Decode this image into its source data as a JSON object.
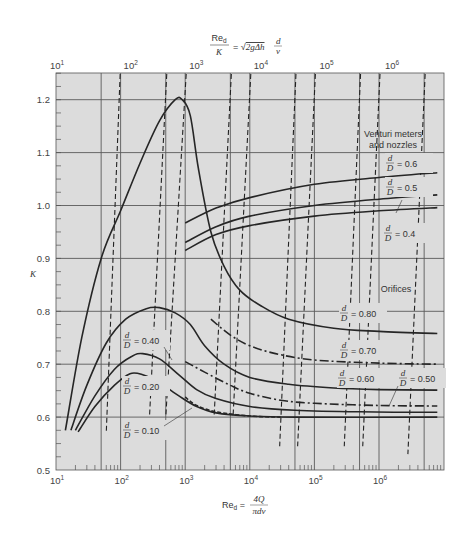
{
  "chart_data": {
    "type": "line",
    "top_axis": {
      "label_numerator": "Re",
      "label_numerator_sub": "d",
      "label_denominator": "K",
      "label_rhs": "= √2gΔh d/ν",
      "ticks": [
        {
          "base": "10",
          "exp": "1",
          "re": 10,
          "x_offset": 0
        },
        {
          "base": "10",
          "exp": "2",
          "re": 100,
          "x_offset": 9
        },
        {
          "base": "10",
          "exp": "3",
          "re": 1000,
          "x_offset": 10
        },
        {
          "base": "10",
          "exp": "4",
          "re": 10000,
          "x_offset": 10
        },
        {
          "base": "10",
          "exp": "5",
          "re": 100000,
          "x_offset": 11
        },
        {
          "base": "10",
          "exp": "6",
          "re": 1000000,
          "x_offset": 12
        }
      ]
    },
    "xaxis": {
      "label_prefix": "Re",
      "label_sub": "d",
      "label_num": "4Q",
      "label_den": "πdν",
      "scale": "log",
      "xlim": [
        10,
        9000000
      ],
      "ticks": [
        {
          "base": "10",
          "exp": "1",
          "re": 10
        },
        {
          "base": "10",
          "exp": "2",
          "re": 100
        },
        {
          "base": "10",
          "exp": "3",
          "re": 1000
        },
        {
          "base": "10",
          "exp": "4",
          "re": 10000
        },
        {
          "base": "10",
          "exp": "5",
          "re": 100000
        },
        {
          "base": "10",
          "exp": "6",
          "re": 1000000
        }
      ],
      "major_gridlines": [
        10,
        50,
        100,
        500,
        1000,
        5000,
        10000,
        50000,
        100000,
        500000,
        1000000,
        5000000
      ]
    },
    "yaxis": {
      "label": "K",
      "ylim": [
        0.5,
        1.25
      ],
      "ticks": [
        "0.5",
        "0.6",
        "0.7",
        "0.8",
        "0.9",
        "1.0",
        "1.1",
        "1.2"
      ],
      "tick_values": [
        0.5,
        0.6,
        0.7,
        0.8,
        0.9,
        1.0,
        1.1,
        1.2
      ],
      "minor_step": 0.025
    },
    "grid": true,
    "series": [
      {
        "name": "Orifice d/D = 0.80",
        "group": "orifices",
        "style": "solid",
        "points": [
          [
            14,
            0.575
          ],
          [
            25,
            0.75
          ],
          [
            50,
            0.9
          ],
          [
            100,
            0.99
          ],
          [
            200,
            1.08
          ],
          [
            400,
            1.16
          ],
          [
            700,
            1.2
          ],
          [
            900,
            1.2
          ],
          [
            1200,
            1.17
          ],
          [
            1600,
            1.07
          ],
          [
            2500,
            0.95
          ],
          [
            4000,
            0.885
          ],
          [
            7000,
            0.84
          ],
          [
            15000,
            0.81
          ],
          [
            40000,
            0.785
          ],
          [
            200000,
            0.768
          ],
          [
            1000000,
            0.762
          ],
          [
            8000000,
            0.758
          ]
        ]
      },
      {
        "name": "Orifice d/D = 0.70",
        "group": "orifices",
        "style": "dashdot",
        "points": [
          [
            2500,
            0.785
          ],
          [
            5000,
            0.755
          ],
          [
            10000,
            0.735
          ],
          [
            25000,
            0.72
          ],
          [
            100000,
            0.708
          ],
          [
            1000000,
            0.702
          ],
          [
            8000000,
            0.7
          ]
        ]
      },
      {
        "name": "Orifice d/D = 0.60",
        "group": "orifices",
        "style": "solid",
        "points": [
          [
            17,
            0.575
          ],
          [
            30,
            0.66
          ],
          [
            60,
            0.74
          ],
          [
            120,
            0.785
          ],
          [
            250,
            0.805
          ],
          [
            400,
            0.807
          ],
          [
            700,
            0.797
          ],
          [
            1200,
            0.775
          ],
          [
            2000,
            0.735
          ],
          [
            4000,
            0.7
          ],
          [
            10000,
            0.675
          ],
          [
            40000,
            0.662
          ],
          [
            200000,
            0.655
          ],
          [
            1000000,
            0.652
          ],
          [
            8000000,
            0.651
          ]
        ]
      },
      {
        "name": "Orifice d/D = 0.50",
        "group": "orifices",
        "style": "dashdot",
        "points": [
          [
            1000,
            0.705
          ],
          [
            2000,
            0.685
          ],
          [
            5000,
            0.66
          ],
          [
            10000,
            0.645
          ],
          [
            30000,
            0.632
          ],
          [
            100000,
            0.626
          ],
          [
            1000000,
            0.622
          ],
          [
            8000000,
            0.621
          ]
        ]
      },
      {
        "name": "Orifice d/D = 0.40",
        "group": "orifices",
        "style": "solid",
        "points": [
          [
            20,
            0.575
          ],
          [
            40,
            0.64
          ],
          [
            80,
            0.69
          ],
          [
            150,
            0.715
          ],
          [
            220,
            0.72
          ],
          [
            400,
            0.71
          ],
          [
            800,
            0.68
          ],
          [
            1500,
            0.652
          ],
          [
            3000,
            0.635
          ],
          [
            10000,
            0.62
          ],
          [
            50000,
            0.613
          ],
          [
            500000,
            0.61
          ],
          [
            8000000,
            0.609
          ]
        ]
      },
      {
        "name": "Orifice d/D = 0.20",
        "group": "orifices",
        "style": "solid",
        "points": [
          [
            22,
            0.572
          ],
          [
            40,
            0.62
          ],
          [
            80,
            0.66
          ],
          [
            140,
            0.682
          ],
          [
            220,
            0.68
          ],
          [
            400,
            0.665
          ],
          [
            800,
            0.64
          ],
          [
            1500,
            0.62
          ],
          [
            3000,
            0.608
          ],
          [
            10000,
            0.602
          ],
          [
            50000,
            0.6
          ],
          [
            8000000,
            0.6
          ]
        ]
      },
      {
        "name": "Orifice d/D = 0.10",
        "group": "orifices",
        "style": "dashed",
        "points": [
          [
            1000,
            0.638
          ],
          [
            1500,
            0.622
          ],
          [
            3000,
            0.61
          ],
          [
            10000,
            0.602
          ],
          [
            30000,
            0.6
          ]
        ]
      },
      {
        "name": "Venturi/nozzle d/D = 0.6",
        "group": "venturi",
        "style": "solid",
        "points": [
          [
            1000,
            0.967
          ],
          [
            3000,
            0.995
          ],
          [
            10000,
            1.015
          ],
          [
            100000,
            1.04
          ],
          [
            1000000,
            1.053
          ],
          [
            8000000,
            1.062
          ]
        ]
      },
      {
        "name": "Venturi/nozzle d/D = 0.5",
        "group": "venturi",
        "style": "solid",
        "points": [
          [
            1000,
            0.93
          ],
          [
            3000,
            0.96
          ],
          [
            10000,
            0.98
          ],
          [
            100000,
            1.0
          ],
          [
            1000000,
            1.012
          ],
          [
            8000000,
            1.02
          ]
        ]
      },
      {
        "name": "Venturi/nozzle d/D = 0.4",
        "group": "venturi",
        "style": "solid",
        "points": [
          [
            1000,
            0.915
          ],
          [
            3000,
            0.945
          ],
          [
            10000,
            0.962
          ],
          [
            100000,
            0.98
          ],
          [
            1000000,
            0.99
          ],
          [
            8000000,
            0.996
          ]
        ]
      }
    ],
    "constant_re_over_k_lines": {
      "style": "dashed",
      "note": "Lines of constant Re_d/K (top axis); top x-positions in Re_d units",
      "lines": [
        {
          "top_re": 95,
          "bottom_re": 60,
          "bottom_k": 0.57
        },
        {
          "top_re": 500,
          "bottom_re": 280,
          "bottom_k": 0.6
        },
        {
          "top_re": 1000,
          "bottom_re": 500,
          "bottom_k": 0.6
        },
        {
          "top_re": 5000,
          "bottom_re": 2800,
          "bottom_k": 0.6
        },
        {
          "top_re": 10000,
          "bottom_re": 5500,
          "bottom_k": 0.6
        },
        {
          "top_re": 50000,
          "bottom_re": 29000,
          "bottom_k": 0.545
        },
        {
          "top_re": 100000,
          "bottom_re": 55000,
          "bottom_k": 0.545
        },
        {
          "top_re": 500000,
          "bottom_re": 290000,
          "bottom_k": 0.545
        },
        {
          "top_re": 1000000,
          "bottom_re": 560000,
          "bottom_k": 0.545
        },
        {
          "top_re": 5000000,
          "bottom_re": 2800000,
          "bottom_k": 0.53
        }
      ]
    },
    "annotations": {
      "venturi_title_1": "Venturi meters",
      "venturi_title_2": "and nozzles",
      "venturi_labels": [
        {
          "frac_num": "d",
          "frac_den": "D",
          "text": "= 0.6"
        },
        {
          "frac_num": "d",
          "frac_den": "D",
          "text": "= 0.5"
        },
        {
          "frac_num": "d",
          "frac_den": "D",
          "text": "= 0.4"
        }
      ],
      "orifices_title": "Orifices",
      "orifice_labels": [
        {
          "frac_num": "d",
          "frac_den": "D",
          "text": "= 0.80"
        },
        {
          "frac_num": "d",
          "frac_den": "D",
          "text": "= 0.70"
        },
        {
          "frac_num": "d",
          "frac_den": "D",
          "text": "= 0.60"
        },
        {
          "frac_num": "d",
          "frac_den": "D",
          "text": "= 0.50"
        },
        {
          "frac_num": "d",
          "frac_den": "D",
          "text": "= 0.40"
        },
        {
          "frac_num": "d",
          "frac_den": "D",
          "text": "= 0.20"
        },
        {
          "frac_num": "d",
          "frac_den": "D",
          "text": "= 0.10"
        }
      ]
    },
    "colors": {
      "plot_background": "#dcdcdc",
      "curve": "#262626",
      "gridline": "#5a5a5a",
      "text": "#3a3a3a"
    }
  }
}
